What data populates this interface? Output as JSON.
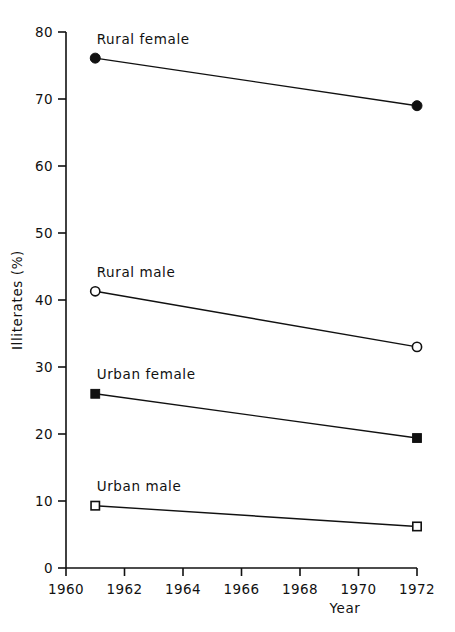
{
  "chart_data": {
    "type": "line",
    "title": "",
    "xlabel": "Year",
    "ylabel": "Illiterates (%)",
    "x": [
      1961,
      1972
    ],
    "xlim": [
      1960,
      1972
    ],
    "ylim": [
      0,
      80
    ],
    "xticks": [
      1960,
      1962,
      1964,
      1966,
      1968,
      1970,
      1972
    ],
    "xtick_labels": [
      "1960",
      "1962",
      "1964",
      "1966",
      "1968",
      "1970",
      "1972"
    ],
    "yticks": [
      0,
      10,
      20,
      30,
      40,
      50,
      60,
      70,
      80
    ],
    "ytick_labels": [
      "0",
      "10",
      "20",
      "30",
      "40",
      "50",
      "60",
      "70",
      "80"
    ],
    "grid": false,
    "legend_position": "inline-labels",
    "series": [
      {
        "name": "Rural female",
        "marker": "filled-circle",
        "values": [
          76.1,
          69.0
        ],
        "label_x": 1961.05,
        "label_y": 79.0
      },
      {
        "name": "Rural male",
        "marker": "open-circle",
        "values": [
          41.3,
          33.0
        ],
        "label_x": 1961.05,
        "label_y": 44.2
      },
      {
        "name": "Urban female",
        "marker": "filled-square",
        "values": [
          26.0,
          19.4
        ],
        "label_x": 1961.05,
        "label_y": 29.0
      },
      {
        "name": "Urban male",
        "marker": "open-square",
        "values": [
          9.3,
          6.2
        ],
        "label_x": 1961.05,
        "label_y": 12.3
      }
    ],
    "colors": {
      "line": "#111111",
      "marker": "#111111",
      "axis": "#111111",
      "background": "#ffffff"
    }
  },
  "figure": {
    "page_artifact": ""
  }
}
